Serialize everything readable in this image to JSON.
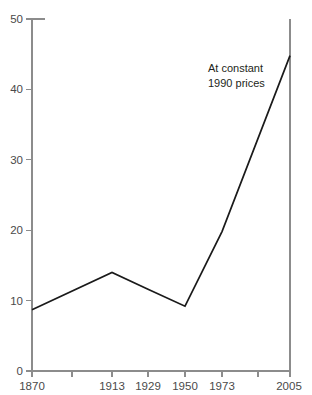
{
  "chart_data": {
    "type": "line",
    "title": "",
    "subtitle": "",
    "xlabel": "",
    "ylabel": "",
    "xlim": [
      1870,
      2005
    ],
    "ylim": [
      0,
      50
    ],
    "grid": false,
    "legend": "none",
    "categories": [
      "1870",
      "1913",
      "1929",
      "1950",
      "1973",
      "2005"
    ],
    "x": [
      1870,
      1913,
      1929,
      1950,
      1973,
      2005
    ],
    "values": [
      8.7,
      14.0,
      11.6,
      9.2,
      19.8,
      44.8
    ],
    "series": [
      {
        "name": "At constant 1990 prices",
        "values": [
          8.7,
          14.0,
          11.6,
          9.2,
          19.8,
          44.8
        ],
        "color": "#1a1a1a"
      }
    ],
    "y_ticks": [
      0,
      10,
      20,
      30,
      40,
      50
    ],
    "y_tick_labels": [
      "0",
      "10",
      "20",
      "30",
      "40",
      "50"
    ],
    "x_ticks": [
      1870,
      1913,
      1929,
      1950,
      1973,
      2005
    ],
    "x_tick_labels": [
      "1870",
      "1913",
      "1929",
      "1950",
      "1973",
      "2005"
    ],
    "annotations": [
      {
        "line1": "At  constant",
        "line2": "1990 prices"
      }
    ]
  },
  "axes": {
    "y": {
      "labels": {
        "t0": "0",
        "t1": "10",
        "t2": "20",
        "t3": "30",
        "t4": "40",
        "t5": "50"
      }
    },
    "x": {
      "labels": {
        "t0": "1870",
        "t1": "1913",
        "t2": "1929",
        "t3": "1950",
        "t4": "1973",
        "t5": "2005"
      }
    }
  },
  "annotation": {
    "line1": "At  constant",
    "line2": "1990 prices"
  },
  "colors": {
    "line": "#1a1a1a",
    "axis": "#8c8c8c",
    "tick_text": "#4a4a4a",
    "background": "#ffffff"
  }
}
